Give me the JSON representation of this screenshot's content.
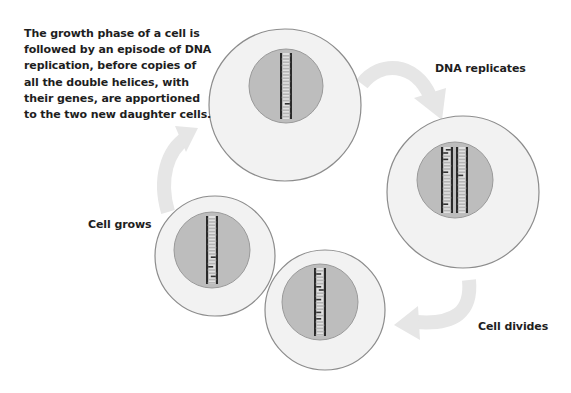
{
  "caption": "The growth phase of a cell is followed by an episode of DNA replication, before copies of all the double helices, with their genes, are apportioned to the two new daughter cells.",
  "stages": {
    "dna_replicates": "DNA replicates",
    "cell_divides": "Cell divides",
    "cell_grows": "Cell grows"
  },
  "cells": [
    {
      "name": "grown-cell",
      "dna_strands": 1
    },
    {
      "name": "replicated-cell",
      "dna_strands": 2
    },
    {
      "name": "daughter-cell-right",
      "dna_strands": 1
    },
    {
      "name": "daughter-cell-left",
      "dna_strands": 1
    }
  ],
  "colors": {
    "cytoplasm": "#f2f2f2",
    "cell_outline": "#8c8c8c",
    "nucleus": "#bdbdbd",
    "nucleus_outline": "#9a9a9a",
    "dna_backbone": "#2a2a2a",
    "dna_base_light": "#e0e0e0",
    "dna_base_dark": "#333333",
    "arrow": "#e6e6e6",
    "text": "#1e1e1e"
  }
}
